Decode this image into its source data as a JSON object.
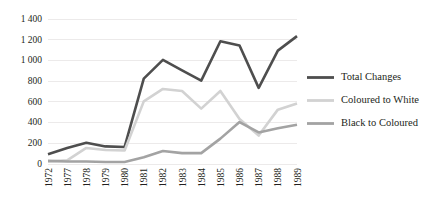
{
  "chart_data": {
    "type": "line",
    "title": "",
    "xlabel": "",
    "ylabel": "",
    "grid": true,
    "legend_position": "right",
    "categories": [
      "1972",
      "1977",
      "1978",
      "1979",
      "1980",
      "1981",
      "1982",
      "1983",
      "1984",
      "1985",
      "1986",
      "1987",
      "1988",
      "1989"
    ],
    "ylim": [
      0,
      1400
    ],
    "yticks": [
      0,
      200,
      400,
      600,
      800,
      1000,
      1200,
      1400
    ],
    "ytick_labels": [
      "0",
      "200",
      "400",
      "600",
      "800",
      "1 000",
      "1 200",
      "1 400"
    ],
    "series": [
      {
        "name": "Total Changes",
        "color": "#4e4e4e",
        "width": 2.6,
        "values": [
          90,
          150,
          200,
          165,
          160,
          820,
          1000,
          900,
          800,
          1180,
          1140,
          730,
          1090,
          1230
        ]
      },
      {
        "name": "Coloured to White",
        "color": "#d2d2d2",
        "width": 2.6,
        "values": [
          20,
          30,
          150,
          130,
          125,
          600,
          720,
          700,
          530,
          700,
          430,
          270,
          520,
          580
        ]
      },
      {
        "name": "Black to Coloured",
        "color": "#a3a3a3",
        "width": 2.6,
        "values": [
          25,
          20,
          20,
          15,
          15,
          60,
          120,
          100,
          100,
          240,
          400,
          300,
          340,
          375
        ]
      }
    ]
  },
  "legend": {
    "items": [
      {
        "label": "Total Changes",
        "color": "#4e4e4e"
      },
      {
        "label": "Coloured to White",
        "color": "#d2d2d2"
      },
      {
        "label": "Black to Coloured",
        "color": "#a3a3a3"
      }
    ]
  }
}
